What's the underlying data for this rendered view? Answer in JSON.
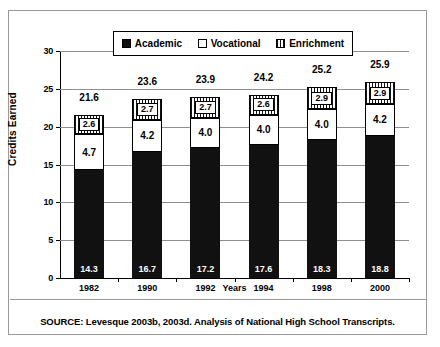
{
  "chart_data": {
    "type": "bar",
    "subtype": "stacked-vertical",
    "title": "",
    "xlabel": "Years",
    "ylabel": "Credits Earned",
    "ylim": [
      0,
      30
    ],
    "ytick_step": 5,
    "yticks": [
      "30",
      "25",
      "20",
      "15",
      "10",
      "5",
      "0"
    ],
    "grid": true,
    "legend_position": "top-center",
    "categories": [
      "1982",
      "1990",
      "1992",
      "1994",
      "1998",
      "2000"
    ],
    "series": [
      {
        "name": "Academic",
        "pattern": "solid-black",
        "color": "#111111",
        "values": [
          14.3,
          16.7,
          17.2,
          17.6,
          18.3,
          18.8
        ]
      },
      {
        "name": "Vocational",
        "pattern": "white-outlined",
        "color": "#ffffff",
        "values": [
          4.7,
          4.2,
          4.0,
          4.0,
          4.0,
          4.2
        ]
      },
      {
        "name": "Enrichment",
        "pattern": "vertical-hatch",
        "color": "#ffffff",
        "values": [
          2.6,
          2.7,
          2.7,
          2.6,
          2.9,
          2.9
        ]
      }
    ],
    "segment_labels": {
      "academic": [
        "14.3",
        "16.7",
        "17.2",
        "17.6",
        "18.3",
        "18.8"
      ],
      "vocational": [
        "4.7",
        "4.2",
        "4.0",
        "4.0",
        "4.0",
        "4.2"
      ],
      "enrichment": [
        "2.6",
        "2.7",
        "2.7",
        "2.6",
        "2.9",
        "2.9"
      ]
    },
    "totals": [
      "21.6",
      "23.6",
      "23.9",
      "24.2",
      "25.2",
      "25.9"
    ],
    "totals_values": [
      21.6,
      23.6,
      23.9,
      24.2,
      25.2,
      25.9
    ]
  },
  "legend": {
    "items": [
      {
        "label": "Academic",
        "swatch": "solid-black-swatch"
      },
      {
        "label": "Vocational",
        "swatch": "white-swatch"
      },
      {
        "label": "Enrichment",
        "swatch": "hatched-swatch"
      }
    ]
  },
  "source": {
    "text": "SOURCE: Levesque 2003b, 2003d. Analysis of National High School Transcripts."
  }
}
